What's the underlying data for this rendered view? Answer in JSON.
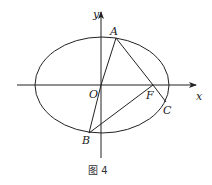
{
  "diagram": {
    "caption": "图 4",
    "axes": {
      "x_label": "x",
      "y_label": "y",
      "origin_label": "O"
    },
    "points": {
      "A": "A",
      "B": "B",
      "C": "C",
      "F": "F"
    },
    "shape": "ellipse",
    "segments": [
      "OA",
      "AF",
      "FC",
      "OB",
      "BF"
    ],
    "colors": {
      "stroke": "#222222",
      "background": "#ffffff"
    }
  }
}
